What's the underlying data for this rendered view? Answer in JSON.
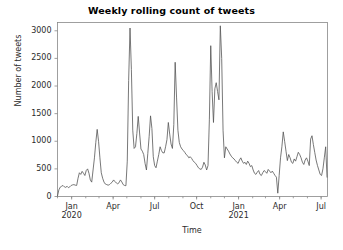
{
  "chart_data": {
    "type": "line",
    "title": "Weekly rolling count of tweets",
    "xlabel": "Time",
    "ylabel": "Number of tweets",
    "ylim": [
      0,
      3150
    ],
    "yticks": [
      0,
      500,
      1000,
      1500,
      2000,
      2500,
      3000
    ],
    "ytick_labels": [
      "0",
      "500",
      "1000",
      "1500",
      "2000",
      "2500",
      "3000"
    ],
    "xlim": [
      "2019-12-01",
      "2021-07-15"
    ],
    "xticks": [
      "2020-01-01",
      "2020-04-01",
      "2020-07-01",
      "2020-10-01",
      "2021-01-01",
      "2021-04-01",
      "2021-07-01"
    ],
    "xtick_labels": [
      {
        "line1": "Jan",
        "line2": "2020"
      },
      {
        "line1": "Apr",
        "line2": ""
      },
      {
        "line1": "Jul",
        "line2": ""
      },
      {
        "line1": "Oct",
        "line2": ""
      },
      {
        "line1": "Jan",
        "line2": "2021"
      },
      {
        "line1": "Apr",
        "line2": ""
      },
      {
        "line1": "Jul",
        "line2": ""
      }
    ],
    "grid": false,
    "legend": null,
    "line_color": "#555555",
    "line_width": 0.8,
    "series": [
      {
        "name": "Weekly rolling count of tweets",
        "x": [
          "2019-12-01",
          "2019-12-04",
          "2019-12-07",
          "2019-12-10",
          "2019-12-13",
          "2019-12-16",
          "2019-12-19",
          "2019-12-22",
          "2019-12-25",
          "2019-12-28",
          "2019-12-31",
          "2020-01-03",
          "2020-01-06",
          "2020-01-09",
          "2020-01-12",
          "2020-01-15",
          "2020-01-18",
          "2020-01-21",
          "2020-01-24",
          "2020-01-27",
          "2020-01-30",
          "2020-02-02",
          "2020-02-05",
          "2020-02-08",
          "2020-02-11",
          "2020-02-14",
          "2020-02-17",
          "2020-02-20",
          "2020-02-23",
          "2020-02-26",
          "2020-02-29",
          "2020-03-03",
          "2020-03-06",
          "2020-03-09",
          "2020-03-12",
          "2020-03-15",
          "2020-03-18",
          "2020-03-21",
          "2020-03-24",
          "2020-03-27",
          "2020-03-30",
          "2020-04-02",
          "2020-04-05",
          "2020-04-08",
          "2020-04-11",
          "2020-04-14",
          "2020-04-17",
          "2020-04-20",
          "2020-04-23",
          "2020-04-26",
          "2020-04-29",
          "2020-05-02",
          "2020-05-05",
          "2020-05-08",
          "2020-05-11",
          "2020-05-14",
          "2020-05-17",
          "2020-05-20",
          "2020-05-23",
          "2020-05-26",
          "2020-05-29",
          "2020-06-01",
          "2020-06-04",
          "2020-06-07",
          "2020-06-10",
          "2020-06-13",
          "2020-06-16",
          "2020-06-19",
          "2020-06-22",
          "2020-06-25",
          "2020-06-28",
          "2020-07-01",
          "2020-07-04",
          "2020-07-07",
          "2020-07-10",
          "2020-07-13",
          "2020-07-16",
          "2020-07-19",
          "2020-07-22",
          "2020-07-25",
          "2020-07-28",
          "2020-07-31",
          "2020-08-03",
          "2020-08-06",
          "2020-08-09",
          "2020-08-12",
          "2020-08-15",
          "2020-08-18",
          "2020-08-21",
          "2020-08-24",
          "2020-08-27",
          "2020-08-30",
          "2020-09-02",
          "2020-09-05",
          "2020-09-08",
          "2020-09-11",
          "2020-09-14",
          "2020-09-17",
          "2020-09-20",
          "2020-09-23",
          "2020-09-26",
          "2020-09-29",
          "2020-10-02",
          "2020-10-05",
          "2020-10-08",
          "2020-10-11",
          "2020-10-14",
          "2020-10-17",
          "2020-10-20",
          "2020-10-23",
          "2020-10-26",
          "2020-10-29",
          "2020-11-01",
          "2020-11-04",
          "2020-11-07",
          "2020-11-10",
          "2020-11-13",
          "2020-11-16",
          "2020-11-19",
          "2020-11-22",
          "2020-11-25",
          "2020-11-28",
          "2020-12-01",
          "2020-12-04",
          "2020-12-07",
          "2020-12-10",
          "2020-12-13",
          "2020-12-16",
          "2020-12-19",
          "2020-12-22",
          "2020-12-25",
          "2020-12-28",
          "2020-12-31",
          "2021-01-03",
          "2021-01-06",
          "2021-01-09",
          "2021-01-12",
          "2021-01-15",
          "2021-01-18",
          "2021-01-21",
          "2021-01-24",
          "2021-01-27",
          "2021-01-30",
          "2021-02-02",
          "2021-02-05",
          "2021-02-08",
          "2021-02-11",
          "2021-02-14",
          "2021-02-17",
          "2021-02-20",
          "2021-02-23",
          "2021-02-26",
          "2021-03-01",
          "2021-03-04",
          "2021-03-07",
          "2021-03-10",
          "2021-03-13",
          "2021-03-16",
          "2021-03-19",
          "2021-03-22",
          "2021-03-25",
          "2021-03-28",
          "2021-03-31",
          "2021-04-03",
          "2021-04-06",
          "2021-04-09",
          "2021-04-12",
          "2021-04-15",
          "2021-04-18",
          "2021-04-21",
          "2021-04-24",
          "2021-04-27",
          "2021-04-30",
          "2021-05-03",
          "2021-05-06",
          "2021-05-09",
          "2021-05-12",
          "2021-05-15",
          "2021-05-18",
          "2021-05-21",
          "2021-05-24",
          "2021-05-27",
          "2021-05-30",
          "2021-06-02",
          "2021-06-05",
          "2021-06-08",
          "2021-06-11",
          "2021-06-14",
          "2021-06-17",
          "2021-06-20",
          "2021-06-23",
          "2021-06-26",
          "2021-06-29",
          "2021-07-02",
          "2021-07-05",
          "2021-07-08",
          "2021-07-11",
          "2021-07-14"
        ],
        "values": [
          10,
          120,
          170,
          185,
          200,
          175,
          165,
          185,
          160,
          175,
          200,
          210,
          215,
          205,
          200,
          330,
          430,
          400,
          455,
          420,
          380,
          470,
          500,
          420,
          300,
          260,
          480,
          700,
          980,
          1215,
          1000,
          700,
          430,
          330,
          260,
          225,
          215,
          205,
          215,
          240,
          260,
          300,
          270,
          245,
          230,
          250,
          300,
          265,
          215,
          200,
          195,
          640,
          2100,
          3050,
          2300,
          1200,
          870,
          900,
          1140,
          1450,
          1150,
          860,
          820,
          760,
          600,
          480,
          780,
          1090,
          1460,
          1230,
          720,
          560,
          520,
          640,
          760,
          900,
          830,
          790,
          790,
          900,
          1030,
          1340,
          1130,
          950,
          870,
          1300,
          2430,
          1800,
          1200,
          980,
          900,
          860,
          830,
          800,
          760,
          740,
          700,
          720,
          690,
          650,
          620,
          600,
          560,
          520,
          500,
          490,
          530,
          620,
          570,
          480,
          560,
          1400,
          2730,
          1900,
          1340,
          1950,
          2060,
          1900,
          1750,
          3090,
          2500,
          1200,
          700,
          900,
          860,
          820,
          770,
          730,
          700,
          680,
          650,
          620,
          600,
          660,
          700,
          640,
          600,
          620,
          580,
          640,
          600,
          540,
          560,
          480,
          420,
          400,
          440,
          470,
          400,
          380,
          430,
          470,
          450,
          420,
          490,
          460,
          430,
          460,
          420,
          380,
          350,
          60,
          380,
          700,
          900,
          1170,
          1000,
          820,
          650,
          760,
          700,
          620,
          600,
          680,
          640,
          720,
          800,
          760,
          700,
          620,
          580,
          660,
          700,
          640,
          560,
          1040,
          1100,
          940,
          800,
          660,
          560,
          480,
          400,
          380,
          500,
          700,
          900,
          350
        ]
      }
    ]
  }
}
